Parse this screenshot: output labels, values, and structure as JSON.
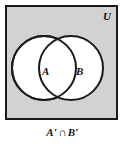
{
  "figure": {
    "kind": "venn-diagram",
    "universe_label": "U",
    "set_a_label": "A",
    "set_b_label": "B",
    "caption": {
      "full": "A′ ∩ B′",
      "left_operand": "A′",
      "operator": "∩",
      "right_operand": "B′"
    },
    "colors": {
      "shaded_region": "#d2d2d2",
      "circle_fill": "#ffffff",
      "stroke": "#1a1a1a",
      "page_background": "#ffffff",
      "text": "#111111"
    },
    "geometry": {
      "frame": {
        "x": 5,
        "y": 5,
        "width": 113,
        "height": 115
      },
      "circle_a": {
        "cx": 42,
        "cy": 66,
        "r": 36
      },
      "circle_b": {
        "cx": 69,
        "cy": 66,
        "r": 36
      }
    }
  }
}
